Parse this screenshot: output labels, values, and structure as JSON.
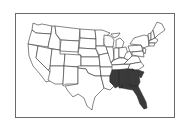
{
  "map": {
    "region": "United States (contiguous)",
    "highlight_color": "#3a3a3a",
    "base_color": "#ffffff",
    "border_color": "#333333",
    "frame_color": "#6a6a6a",
    "highlighted_states": [
      "Mississippi",
      "Alabama",
      "Georgia",
      "South Carolina",
      "Florida"
    ]
  }
}
